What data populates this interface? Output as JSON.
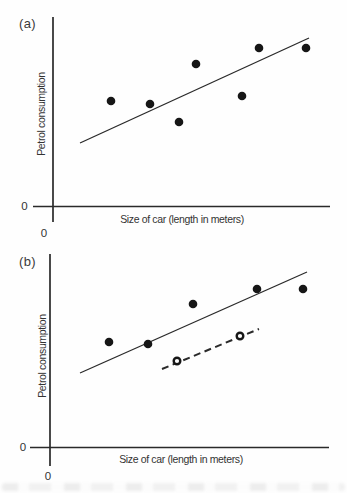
{
  "figure": {
    "paper": "#fefefe",
    "ink": "#2a2a2a",
    "marker_ink": "#161616"
  },
  "chart_data": [
    {
      "type": "scatter",
      "id": "a",
      "panel_tag": "(a)",
      "title": "",
      "xlabel": "Size of car (length in meters)",
      "ylabel": "Petrol consumption",
      "origin_labels": {
        "x_axis_zero": "0",
        "y_axis_zero": "0"
      },
      "series": [
        {
          "key": "data-point",
          "name": "cars (filled circles)",
          "marker": "filled-circle",
          "marker_radius": 4.3,
          "points_px": [
            [
              111,
              101
            ],
            [
              150,
              104
            ],
            [
              179,
              122
            ],
            [
              196,
              64
            ],
            [
              242,
              96
            ],
            [
              259,
              48
            ],
            [
              306,
              48
            ]
          ]
        }
      ],
      "lines": [
        {
          "key": "fit-line",
          "name": "fitted straight line",
          "style": "solid",
          "width": 1.3,
          "from_px": [
            80,
            143
          ],
          "to_px": [
            309,
            38
          ]
        }
      ],
      "layout_px": {
        "y_axis": {
          "x": 53,
          "y1": 17,
          "y2": 222,
          "width": 1.7
        },
        "x_axis": {
          "y": 206.5,
          "x1": 33,
          "x2": 330,
          "width": 1.7
        }
      }
    },
    {
      "type": "scatter",
      "id": "b",
      "panel_tag": "(b)",
      "title": "",
      "xlabel": "Size of car (length in meters)",
      "ylabel": "Petrol consumption",
      "origin_labels": {
        "x_axis_zero": "0",
        "y_axis_zero": "0"
      },
      "series": [
        {
          "key": "data-point",
          "name": "cars (filled circles)",
          "marker": "filled-circle",
          "marker_radius": 4.3,
          "points_px": [
            [
              109,
              342
            ],
            [
              148,
              344
            ],
            [
              193,
              304
            ],
            [
              257,
              289
            ],
            [
              303,
              289
            ]
          ]
        },
        {
          "key": "open-data-point",
          "name": "subset of cars (open circles)",
          "marker": "open-circle",
          "marker_radius": 3.3,
          "stroke_width": 2.4,
          "points_px": [
            [
              177,
              361
            ],
            [
              240,
              336
            ]
          ]
        }
      ],
      "lines": [
        {
          "key": "fit-line",
          "name": "fitted line through filled points",
          "style": "solid",
          "width": 1.3,
          "from_px": [
            80,
            373
          ],
          "to_px": [
            307,
            272
          ]
        },
        {
          "key": "subset-fit-line",
          "name": "dashed fitted line through open points",
          "style": "dashed",
          "dash": [
            7,
            4.5
          ],
          "width": 2,
          "from_px": [
            162,
            369
          ],
          "to_px": [
            259,
            329
          ]
        }
      ],
      "layout_px": {
        "y_axis": {
          "x": 50,
          "y1": 254,
          "y2": 466,
          "width": 1.7
        },
        "x_axis": {
          "y": 447.5,
          "x1": 30,
          "x2": 329,
          "width": 1.7
        }
      }
    }
  ]
}
